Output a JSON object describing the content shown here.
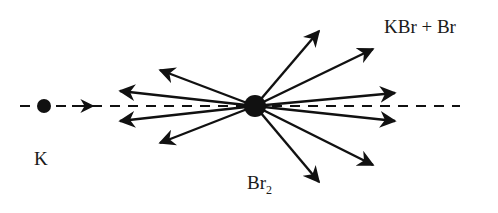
{
  "labels": {
    "reactant_atom": "K",
    "target_molecule": "Br",
    "target_subscript": "2",
    "products": "KBr + Br"
  },
  "colors": {
    "ink": "#111111",
    "background": "#ffffff"
  },
  "geometry": {
    "center": [
      255,
      106
    ],
    "k_atom": [
      44,
      106
    ],
    "beam_arrow_tip": [
      92,
      106
    ],
    "scatter_tips": [
      [
        160,
        70
      ],
      [
        120,
        91
      ],
      [
        120,
        121
      ],
      [
        160,
        143
      ],
      [
        319,
        31
      ],
      [
        373,
        49
      ],
      [
        395,
        93
      ],
      [
        395,
        121
      ],
      [
        373,
        165
      ],
      [
        319,
        182
      ]
    ]
  }
}
